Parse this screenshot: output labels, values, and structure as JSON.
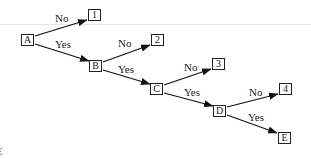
{
  "diagram": {
    "type": "decision-tree",
    "nodes": {
      "A": {
        "label": "A"
      },
      "B": {
        "label": "B"
      },
      "C": {
        "label": "C"
      },
      "D": {
        "label": "D"
      },
      "E": {
        "label": "E"
      },
      "n1": {
        "label": "1"
      },
      "n2": {
        "label": "2"
      },
      "n3": {
        "label": "3"
      },
      "n4": {
        "label": "4"
      }
    },
    "edges": [
      {
        "from": "A",
        "to": "1",
        "label": "No"
      },
      {
        "from": "A",
        "to": "B",
        "label": "Yes"
      },
      {
        "from": "B",
        "to": "2",
        "label": "No"
      },
      {
        "from": "B",
        "to": "C",
        "label": "Yes"
      },
      {
        "from": "C",
        "to": "3",
        "label": "No"
      },
      {
        "from": "C",
        "to": "D",
        "label": "Yes"
      },
      {
        "from": "D",
        "to": "4",
        "label": "No"
      },
      {
        "from": "D",
        "to": "E",
        "label": "Yes"
      }
    ],
    "edge_labels": {
      "a_no": "No",
      "a_yes": "Yes",
      "b_no": "No",
      "b_yes": "Yes",
      "c_no": "No",
      "c_yes": "Yes",
      "d_no": "No",
      "d_yes": "Yes"
    },
    "left_fragment": "E"
  }
}
